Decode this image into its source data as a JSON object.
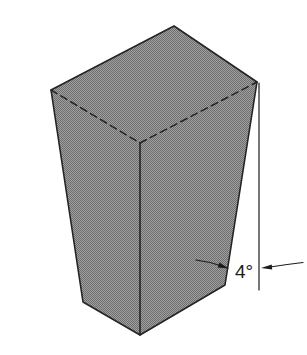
{
  "figure": {
    "angle_label": "4°",
    "colors": {
      "halftone_light": "#a0a0a0",
      "halftone_dark": "#6e6e6e",
      "edge": "#242424",
      "dimension": "#1c1c1c",
      "label_text": "#1c1c1c"
    }
  }
}
